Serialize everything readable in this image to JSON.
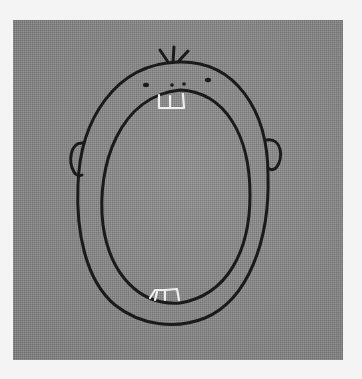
{
  "image": {
    "description": "Embroidered cartoon face with wide-open mouth on grey linen fabric",
    "colors": {
      "background": "#f4f4f4",
      "fabric": "#8a8a8a",
      "thread_dark": "#1a1a1a",
      "thread_teeth": "#f0f0f0"
    },
    "elements": {
      "hair": "three tufts of hair",
      "eyes": "two dot eyes",
      "nose": "two dot nostrils",
      "upper_teeth": "two white stitched upper teeth",
      "lower_teeth": "two white stitched lower teeth",
      "ears": "left and right ears",
      "head": "oval head outline",
      "mouth": "large oval open mouth"
    }
  }
}
